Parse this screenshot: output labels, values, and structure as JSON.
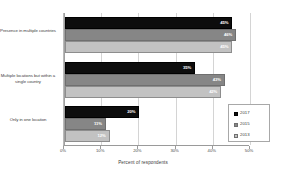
{
  "chart_data": {
    "type": "bar",
    "orientation": "horizontal",
    "title": "",
    "xlabel": "Percent of respondents",
    "ylabel": "",
    "xlim": [
      0,
      50
    ],
    "xticks": [
      "0%",
      "10%",
      "20%",
      "30%",
      "40%",
      "50%"
    ],
    "xtick_values": [
      0,
      10,
      20,
      30,
      40,
      50
    ],
    "grid": true,
    "legend_position": "bottom-right",
    "categories": [
      "Presence in multiple countries",
      "Multiple locations but within a single country",
      "Only in one location"
    ],
    "series": [
      {
        "name": "2017",
        "color": "#0d0d0d",
        "values": [
          45,
          35,
          20
        ],
        "labels": [
          "45%",
          "35%",
          "20%"
        ]
      },
      {
        "name": "2015",
        "color": "#868686",
        "values": [
          46,
          43,
          11
        ],
        "labels": [
          "46%",
          "43%",
          "11%"
        ]
      },
      {
        "name": "2013",
        "color": "#c2c2c2",
        "values": [
          45,
          42,
          12
        ],
        "labels": [
          "45%",
          "42%",
          "12%"
        ]
      }
    ]
  },
  "legend": {
    "items": [
      {
        "label": "2017"
      },
      {
        "label": "2015"
      },
      {
        "label": "2013"
      }
    ]
  },
  "axis": {
    "x_title": "Percent of respondents"
  }
}
